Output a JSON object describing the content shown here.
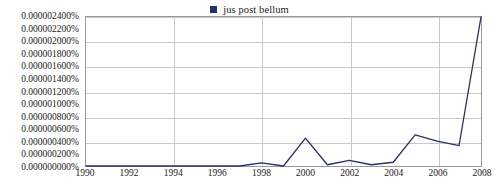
{
  "legend": {
    "entries": [
      {
        "label": "jus post bellum",
        "color": "#27306b",
        "marker": "square-marker"
      }
    ]
  },
  "axes": {
    "y_labels": [
      "0.000002400%",
      "0.000002200%",
      "0.000002000%",
      "0.000001800%",
      "0.000001600%",
      "0.000001400%",
      "0.000001200%",
      "0.000001000%",
      "0.000000800%",
      "0.000000600%",
      "0.000000400%",
      "0.000000200%",
      "0.000000000%"
    ],
    "x_labels": [
      "1990",
      "1992",
      "1994",
      "1996",
      "1998",
      "2000",
      "2002",
      "2004",
      "2006",
      "2008"
    ],
    "x_gridline_years": [
      1994,
      1998,
      2002,
      2006
    ],
    "y_gridline_values": [
      4e-07,
      8e-07,
      1.2e-06,
      1.6e-06,
      2e-06,
      2.4e-06
    ]
  },
  "colors": {
    "series_line": "#27306b",
    "gridline": "#c9c9c9",
    "frame": "#9a9a9a",
    "background": "#ffffff",
    "text": "#1a1a1a"
  },
  "chart_data": {
    "type": "line",
    "title": "",
    "subtitle": "",
    "xlabel": "",
    "ylabel": "",
    "xlim": [
      1990,
      2008
    ],
    "ylim": [
      0.0,
      2.4e-06
    ],
    "grid": true,
    "legend_position": "top-center",
    "x_tick_labels": [
      "1990",
      "1992",
      "1994",
      "1996",
      "1998",
      "2000",
      "2002",
      "2004",
      "2006",
      "2008"
    ],
    "y_tick_labels": [
      "0.000000000%",
      "0.000000200%",
      "0.000000400%",
      "0.000000600%",
      "0.000000800%",
      "0.000001000%",
      "0.000001200%",
      "0.000001400%",
      "0.000001600%",
      "0.000001800%",
      "0.000002000%",
      "0.000002200%",
      "0.000002400%"
    ],
    "y_unit": "percent",
    "series": [
      {
        "name": "jus post bellum",
        "color": "#27306b",
        "x": [
          1990,
          1991,
          1992,
          1993,
          1994,
          1995,
          1996,
          1997,
          1998,
          1999,
          2000,
          2001,
          2002,
          2003,
          2004,
          2005,
          2006,
          2007,
          2008
        ],
        "values": [
          0.0,
          0.0,
          0.0,
          0.0,
          0.0,
          0.0,
          0.0,
          0.0,
          5e-08,
          0.0,
          4.5e-07,
          2e-08,
          9e-08,
          2e-08,
          6e-08,
          5e-07,
          4e-07,
          3.3e-07,
          2.4e-06
        ]
      }
    ]
  }
}
